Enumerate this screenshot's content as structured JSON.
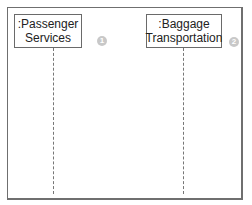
{
  "diagram": {
    "type": "sequence-diagram",
    "lifelines": [
      {
        "label_line1": ":Passenger",
        "label_line2": "Services",
        "badge": "1"
      },
      {
        "label_line1": ":Baggage",
        "label_line2": "Transportation",
        "badge": "2"
      }
    ],
    "colors": {
      "border": "#6a6a6a",
      "badge": "#c8c8c8",
      "background": "#ffffff"
    }
  }
}
